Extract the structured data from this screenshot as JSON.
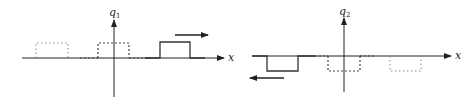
{
  "diagram": {
    "type": "wave-pulse-propagation",
    "panels": [
      {
        "id": "left",
        "y_axis_label": "q",
        "y_axis_subscript": "1",
        "x_axis_label": "x",
        "pulse_direction": "right",
        "pulse_sign": "positive",
        "pulses": [
          {
            "style": "dotted",
            "position": "left"
          },
          {
            "style": "dashed",
            "position": "origin"
          },
          {
            "style": "solid",
            "position": "right"
          }
        ]
      },
      {
        "id": "right",
        "y_axis_label": "q",
        "y_axis_subscript": "2",
        "x_axis_label": "x",
        "pulse_direction": "left",
        "pulse_sign": "negative",
        "pulses": [
          {
            "style": "solid",
            "position": "left"
          },
          {
            "style": "dashed",
            "position": "origin"
          },
          {
            "style": "dotted",
            "position": "right"
          }
        ]
      }
    ],
    "colors": {
      "axis": "#222222",
      "solid": "#333333",
      "dashed": "#444444",
      "dotted": "#888888"
    }
  }
}
